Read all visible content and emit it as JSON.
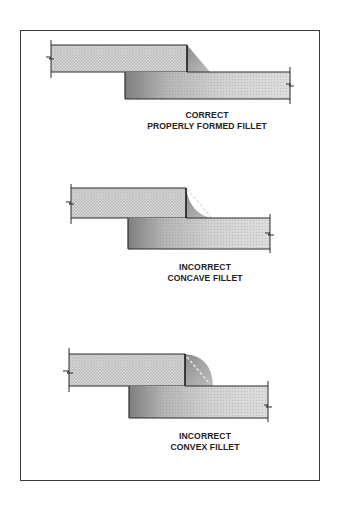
{
  "diagram": {
    "colors": {
      "frame": "#3a3a3a",
      "outline": "#2a2a2a",
      "top_plate_fill": "#cfcfcf",
      "bottom_plate_fill_dark": "#8a8a8a",
      "bottom_plate_fill_light": "#e2e2e2",
      "fillet_fill": "#9a9a9a",
      "dashed_guide": "#eeeeee"
    },
    "figures": [
      {
        "id": "correct",
        "fillet_shape": "straight",
        "label_line1": "CORRECT",
        "label_line2": "PROPERLY FORMED FILLET"
      },
      {
        "id": "concave",
        "fillet_shape": "concave",
        "label_line1": "INCORRECT",
        "label_line2": "CONCAVE FILLET"
      },
      {
        "id": "convex",
        "fillet_shape": "convex",
        "label_line1": "INCORRECT",
        "label_line2": "CONVEX FILLET"
      }
    ]
  }
}
